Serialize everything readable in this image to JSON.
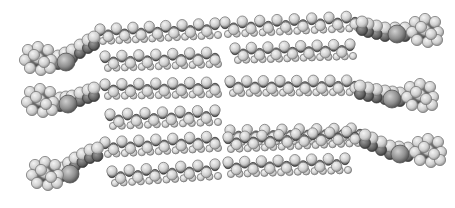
{
  "image": {
    "description": "Grayscale space-filling molecular model of lipid molecules with interdigitated hydrocarbon chains",
    "width": 455,
    "height": 208,
    "background": "#ffffff"
  },
  "palette": {
    "hydrogen_fill": "#d8d8d8",
    "hydrogen_edge": "#7a7a7a",
    "carbon_fill": "#6e6e6e",
    "carbon_edge": "#3c3c3c",
    "heavy_fill": "#8c8c8c",
    "heavy_edge": "#505050"
  },
  "chains": [
    {
      "x1": 100,
      "y1": 33,
      "x2": 215,
      "y2": 27,
      "side": "left"
    },
    {
      "x1": 225,
      "y1": 26,
      "x2": 355,
      "y2": 20,
      "side": "right"
    },
    {
      "x1": 105,
      "y1": 60,
      "x2": 215,
      "y2": 56,
      "side": "left"
    },
    {
      "x1": 235,
      "y1": 52,
      "x2": 350,
      "y2": 48,
      "side": "right"
    },
    {
      "x1": 105,
      "y1": 88,
      "x2": 215,
      "y2": 86,
      "side": "left"
    },
    {
      "x1": 230,
      "y1": 85,
      "x2": 355,
      "y2": 84,
      "side": "right"
    },
    {
      "x1": 110,
      "y1": 118,
      "x2": 215,
      "y2": 114,
      "side": "left"
    },
    {
      "x1": 230,
      "y1": 134,
      "x2": 360,
      "y2": 132,
      "side": "right"
    },
    {
      "x1": 105,
      "y1": 146,
      "x2": 215,
      "y2": 140,
      "side": "left"
    },
    {
      "x1": 228,
      "y1": 141,
      "x2": 355,
      "y2": 135,
      "side": "right"
    },
    {
      "x1": 112,
      "y1": 175,
      "x2": 215,
      "y2": 168,
      "side": "left"
    },
    {
      "x1": 228,
      "y1": 166,
      "x2": 345,
      "y2": 162,
      "side": "right"
    }
  ],
  "head_groups": [
    {
      "cx": 38,
      "cy": 58,
      "side": "left"
    },
    {
      "cx": 40,
      "cy": 100,
      "side": "left"
    },
    {
      "cx": 45,
      "cy": 173,
      "side": "left"
    },
    {
      "cx": 425,
      "cy": 30,
      "side": "right"
    },
    {
      "cx": 420,
      "cy": 95,
      "side": "right"
    },
    {
      "cx": 428,
      "cy": 150,
      "side": "right"
    }
  ],
  "linkers": [
    {
      "points": [
        [
          58,
          58
        ],
        [
          72,
          52
        ],
        [
          88,
          42
        ],
        [
          100,
          36
        ]
      ]
    },
    {
      "points": [
        [
          60,
          100
        ],
        [
          72,
          98
        ],
        [
          88,
          92
        ],
        [
          100,
          88
        ]
      ]
    },
    {
      "points": [
        [
          62,
          170
        ],
        [
          75,
          160
        ],
        [
          90,
          152
        ],
        [
          105,
          148
        ]
      ]
    },
    {
      "points": [
        [
          405,
          30
        ],
        [
          385,
          30
        ],
        [
          368,
          26
        ],
        [
          356,
          22
        ]
      ]
    },
    {
      "points": [
        [
          400,
          95
        ],
        [
          385,
          93
        ],
        [
          368,
          90
        ],
        [
          352,
          86
        ]
      ]
    },
    {
      "points": [
        [
          408,
          150
        ],
        [
          390,
          148
        ],
        [
          372,
          140
        ],
        [
          358,
          134
        ]
      ]
    }
  ]
}
